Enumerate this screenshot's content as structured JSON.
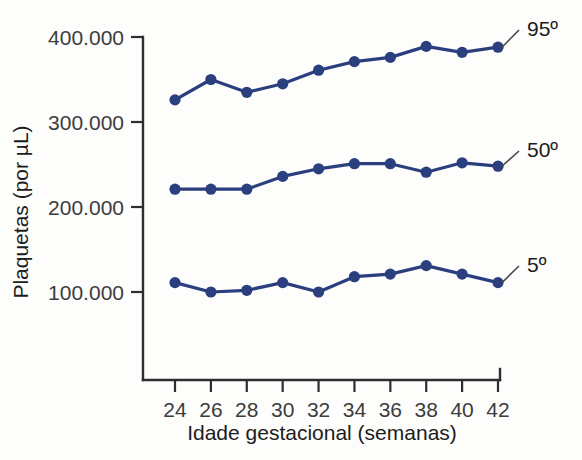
{
  "chart_data": {
    "type": "line",
    "title": "",
    "xlabel": "Idade gestacional (semanas)",
    "ylabel": "Plaquetas (por µL)",
    "x": [
      24,
      26,
      28,
      30,
      32,
      34,
      36,
      38,
      40,
      42
    ],
    "xtick_labels": [
      "24",
      "26",
      "28",
      "30",
      "32",
      "34",
      "36",
      "38",
      "40",
      "42"
    ],
    "ytick_labels": [
      "400.000",
      "300.000",
      "200.000",
      "100.000"
    ],
    "ytick_values": [
      400000,
      300000,
      200000,
      100000
    ],
    "xlim": [
      23,
      43
    ],
    "ylim": [
      55000,
      400000
    ],
    "grid": false,
    "legend_position": "right-inline",
    "series": [
      {
        "name": "95º",
        "label": "95º",
        "color": "#2b3f7f",
        "values": [
          326000,
          350000,
          335000,
          345000,
          361000,
          371000,
          376000,
          389000,
          382000,
          388000
        ]
      },
      {
        "name": "50º",
        "label": "50º",
        "color": "#2b3f7f",
        "values": [
          221000,
          221000,
          221000,
          236000,
          245000,
          251000,
          251000,
          241000,
          252000,
          248000
        ]
      },
      {
        "name": "5º",
        "label": "5º",
        "color": "#2b3f7f",
        "values": [
          111000,
          100000,
          102000,
          111000,
          100000,
          118000,
          121000,
          131000,
          121000,
          111000
        ]
      }
    ],
    "colors": {
      "series": "#2b3f7f",
      "axis": "#2e2e2e",
      "tick_text": "#3c3c3c",
      "title_text": "#1c1c1c",
      "background": "#fdfdfc"
    }
  }
}
